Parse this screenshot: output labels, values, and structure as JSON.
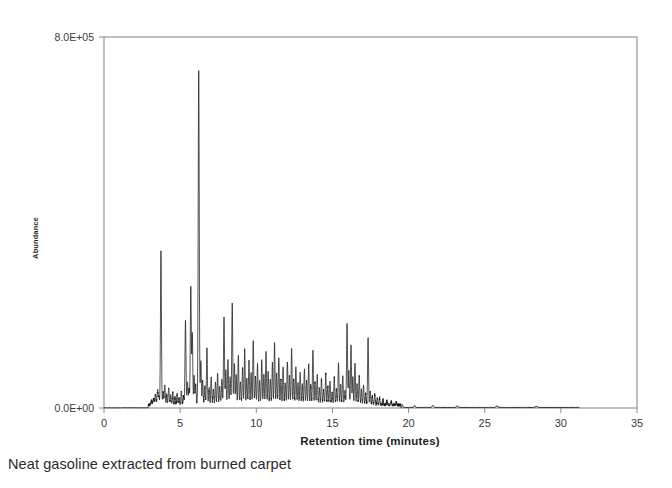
{
  "caption": "Neat gasoline extracted from burned carpet",
  "chart_data": {
    "type": "line",
    "title": "",
    "xlabel": "Retention time (minutes)",
    "ylabel": "Abundance",
    "xlim": [
      0,
      35
    ],
    "ylim": [
      0,
      800000
    ],
    "grid": false,
    "legend": "none",
    "xticks": [
      0,
      5,
      10,
      15,
      20,
      25,
      30,
      35
    ],
    "xtick_labels": [
      "0",
      "5",
      "10",
      "15",
      "20",
      "25",
      "30",
      "35"
    ],
    "yticks": [
      0,
      800000
    ],
    "ytick_labels": [
      "0.0E+00",
      "8.0E+05"
    ],
    "series": [
      {
        "name": "TIC",
        "description": "Total ion chromatogram of neat gasoline extracted from burned carpet",
        "x_start": 0.0,
        "x_end": 31.2,
        "baseline": 4000,
        "peaks": [
          {
            "rt": 3.12,
            "height": 9000,
            "width": 0.035
          },
          {
            "rt": 3.26,
            "height": 14000,
            "width": 0.035
          },
          {
            "rt": 3.38,
            "height": 22000,
            "width": 0.035
          },
          {
            "rt": 3.52,
            "height": 31000,
            "width": 0.035
          },
          {
            "rt": 3.61,
            "height": 18000,
            "width": 0.03
          },
          {
            "rt": 3.74,
            "height": 330000,
            "width": 0.032
          },
          {
            "rt": 3.88,
            "height": 26000,
            "width": 0.032
          },
          {
            "rt": 3.99,
            "height": 41000,
            "width": 0.032
          },
          {
            "rt": 4.12,
            "height": 22000,
            "width": 0.03
          },
          {
            "rt": 4.25,
            "height": 35000,
            "width": 0.032
          },
          {
            "rt": 4.38,
            "height": 19000,
            "width": 0.03
          },
          {
            "rt": 4.52,
            "height": 27000,
            "width": 0.03
          },
          {
            "rt": 4.66,
            "height": 16000,
            "width": 0.03
          },
          {
            "rt": 4.8,
            "height": 23000,
            "width": 0.03
          },
          {
            "rt": 4.93,
            "height": 14000,
            "width": 0.03
          },
          {
            "rt": 5.08,
            "height": 30000,
            "width": 0.03
          },
          {
            "rt": 5.22,
            "height": 18000,
            "width": 0.03
          },
          {
            "rt": 5.35,
            "height": 180000,
            "width": 0.032
          },
          {
            "rt": 5.48,
            "height": 48000,
            "width": 0.03
          },
          {
            "rt": 5.58,
            "height": 34000,
            "width": 0.03
          },
          {
            "rt": 5.7,
            "height": 255000,
            "width": 0.033
          },
          {
            "rt": 5.8,
            "height": 150000,
            "width": 0.03
          },
          {
            "rt": 5.92,
            "height": 60000,
            "width": 0.03
          },
          {
            "rt": 6.02,
            "height": 44000,
            "width": 0.03
          },
          {
            "rt": 6.22,
            "height": 720000,
            "width": 0.034
          },
          {
            "rt": 6.36,
            "height": 95000,
            "width": 0.03
          },
          {
            "rt": 6.48,
            "height": 52000,
            "width": 0.03
          },
          {
            "rt": 6.62,
            "height": 40000,
            "width": 0.03
          },
          {
            "rt": 6.76,
            "height": 120000,
            "width": 0.03
          },
          {
            "rt": 6.9,
            "height": 36000,
            "width": 0.03
          },
          {
            "rt": 7.04,
            "height": 58000,
            "width": 0.03
          },
          {
            "rt": 7.18,
            "height": 30000,
            "width": 0.03
          },
          {
            "rt": 7.32,
            "height": 46000,
            "width": 0.03
          },
          {
            "rt": 7.46,
            "height": 66000,
            "width": 0.03
          },
          {
            "rt": 7.6,
            "height": 38000,
            "width": 0.03
          },
          {
            "rt": 7.74,
            "height": 52000,
            "width": 0.03
          },
          {
            "rt": 7.88,
            "height": 185000,
            "width": 0.032
          },
          {
            "rt": 8.0,
            "height": 72000,
            "width": 0.03
          },
          {
            "rt": 8.14,
            "height": 95000,
            "width": 0.03
          },
          {
            "rt": 8.28,
            "height": 58000,
            "width": 0.03
          },
          {
            "rt": 8.42,
            "height": 215000,
            "width": 0.032
          },
          {
            "rt": 8.56,
            "height": 88000,
            "width": 0.03
          },
          {
            "rt": 8.68,
            "height": 62000,
            "width": 0.03
          },
          {
            "rt": 8.82,
            "height": 105000,
            "width": 0.03
          },
          {
            "rt": 8.96,
            "height": 48000,
            "width": 0.03
          },
          {
            "rt": 9.1,
            "height": 78000,
            "width": 0.03
          },
          {
            "rt": 9.24,
            "height": 120000,
            "width": 0.03
          },
          {
            "rt": 9.38,
            "height": 55000,
            "width": 0.03
          },
          {
            "rt": 9.52,
            "height": 92000,
            "width": 0.03
          },
          {
            "rt": 9.66,
            "height": 66000,
            "width": 0.03
          },
          {
            "rt": 9.8,
            "height": 135000,
            "width": 0.03
          },
          {
            "rt": 9.94,
            "height": 58000,
            "width": 0.03
          },
          {
            "rt": 10.08,
            "height": 84000,
            "width": 0.03
          },
          {
            "rt": 10.22,
            "height": 48000,
            "width": 0.03
          },
          {
            "rt": 10.36,
            "height": 96000,
            "width": 0.03
          },
          {
            "rt": 10.5,
            "height": 62000,
            "width": 0.03
          },
          {
            "rt": 10.64,
            "height": 110000,
            "width": 0.03
          },
          {
            "rt": 10.78,
            "height": 70000,
            "width": 0.03
          },
          {
            "rt": 10.92,
            "height": 52000,
            "width": 0.03
          },
          {
            "rt": 11.06,
            "height": 88000,
            "width": 0.03
          },
          {
            "rt": 11.2,
            "height": 130000,
            "width": 0.03
          },
          {
            "rt": 11.34,
            "height": 64000,
            "width": 0.03
          },
          {
            "rt": 11.48,
            "height": 100000,
            "width": 0.03
          },
          {
            "rt": 11.62,
            "height": 56000,
            "width": 0.03
          },
          {
            "rt": 11.76,
            "height": 78000,
            "width": 0.03
          },
          {
            "rt": 11.9,
            "height": 44000,
            "width": 0.03
          },
          {
            "rt": 12.04,
            "height": 92000,
            "width": 0.03
          },
          {
            "rt": 12.18,
            "height": 60000,
            "width": 0.03
          },
          {
            "rt": 12.32,
            "height": 118000,
            "width": 0.03
          },
          {
            "rt": 12.46,
            "height": 54000,
            "width": 0.03
          },
          {
            "rt": 12.6,
            "height": 80000,
            "width": 0.03
          },
          {
            "rt": 12.74,
            "height": 46000,
            "width": 0.03
          },
          {
            "rt": 12.88,
            "height": 68000,
            "width": 0.03
          },
          {
            "rt": 13.02,
            "height": 42000,
            "width": 0.03
          },
          {
            "rt": 13.16,
            "height": 74000,
            "width": 0.03
          },
          {
            "rt": 13.3,
            "height": 50000,
            "width": 0.03
          },
          {
            "rt": 13.44,
            "height": 86000,
            "width": 0.03
          },
          {
            "rt": 13.58,
            "height": 40000,
            "width": 0.03
          },
          {
            "rt": 13.72,
            "height": 118000,
            "width": 0.03
          },
          {
            "rt": 13.86,
            "height": 48000,
            "width": 0.03
          },
          {
            "rt": 14.0,
            "height": 62000,
            "width": 0.03
          },
          {
            "rt": 14.14,
            "height": 36000,
            "width": 0.03
          },
          {
            "rt": 14.28,
            "height": 54000,
            "width": 0.03
          },
          {
            "rt": 14.42,
            "height": 30000,
            "width": 0.03
          },
          {
            "rt": 14.56,
            "height": 66000,
            "width": 0.03
          },
          {
            "rt": 14.7,
            "height": 38000,
            "width": 0.03
          },
          {
            "rt": 14.84,
            "height": 48000,
            "width": 0.03
          },
          {
            "rt": 14.98,
            "height": 28000,
            "width": 0.03
          },
          {
            "rt": 15.12,
            "height": 58000,
            "width": 0.03
          },
          {
            "rt": 15.26,
            "height": 34000,
            "width": 0.03
          },
          {
            "rt": 15.4,
            "height": 90000,
            "width": 0.03
          },
          {
            "rt": 15.54,
            "height": 42000,
            "width": 0.03
          },
          {
            "rt": 15.68,
            "height": 62000,
            "width": 0.03
          },
          {
            "rt": 15.82,
            "height": 30000,
            "width": 0.03
          },
          {
            "rt": 15.96,
            "height": 175000,
            "width": 0.032
          },
          {
            "rt": 16.08,
            "height": 72000,
            "width": 0.03
          },
          {
            "rt": 16.22,
            "height": 128000,
            "width": 0.03
          },
          {
            "rt": 16.34,
            "height": 58000,
            "width": 0.03
          },
          {
            "rt": 16.48,
            "height": 90000,
            "width": 0.03
          },
          {
            "rt": 16.62,
            "height": 44000,
            "width": 0.03
          },
          {
            "rt": 16.76,
            "height": 62000,
            "width": 0.03
          },
          {
            "rt": 16.9,
            "height": 32000,
            "width": 0.03
          },
          {
            "rt": 17.04,
            "height": 40000,
            "width": 0.03
          },
          {
            "rt": 17.18,
            "height": 24000,
            "width": 0.03
          },
          {
            "rt": 17.34,
            "height": 145000,
            "width": 0.03
          },
          {
            "rt": 17.48,
            "height": 28000,
            "width": 0.03
          },
          {
            "rt": 17.62,
            "height": 18000,
            "width": 0.03
          },
          {
            "rt": 17.78,
            "height": 22000,
            "width": 0.03
          },
          {
            "rt": 17.94,
            "height": 14000,
            "width": 0.03
          },
          {
            "rt": 18.1,
            "height": 16000,
            "width": 0.03
          },
          {
            "rt": 18.32,
            "height": 11000,
            "width": 0.03
          },
          {
            "rt": 18.58,
            "height": 9000,
            "width": 0.03
          },
          {
            "rt": 18.86,
            "height": 7000,
            "width": 0.03
          },
          {
            "rt": 19.2,
            "height": 6000,
            "width": 0.03
          },
          {
            "rt": 19.6,
            "height": 5000,
            "width": 0.03
          },
          {
            "rt": 20.4,
            "height": 4000,
            "width": 0.04
          },
          {
            "rt": 21.6,
            "height": 3500,
            "width": 0.05
          },
          {
            "rt": 23.2,
            "height": 3000,
            "width": 0.05
          },
          {
            "rt": 25.8,
            "height": 2800,
            "width": 0.06
          },
          {
            "rt": 28.4,
            "height": 2500,
            "width": 0.06
          }
        ]
      }
    ]
  }
}
